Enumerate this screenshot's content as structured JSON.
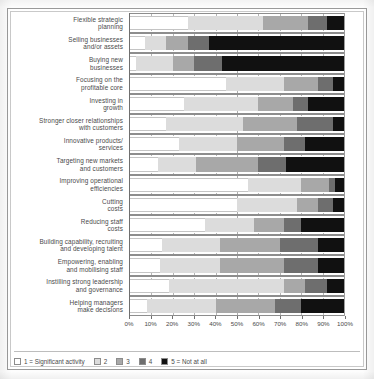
{
  "chart_data": {
    "type": "bar",
    "orientation": "horizontal",
    "stacked": true,
    "stack_mode": "percent",
    "title": "",
    "xlabel": "",
    "ylabel": "",
    "xlim": [
      0,
      100
    ],
    "grid": true,
    "legend_position": "bottom",
    "xticks": [
      "0%",
      "10%",
      "20%",
      "30%",
      "40%",
      "50%",
      "60%",
      "70%",
      "80%",
      "90%",
      "100%"
    ],
    "xtick_values": [
      0,
      10,
      20,
      30,
      40,
      50,
      60,
      70,
      80,
      90,
      100
    ],
    "legend": [
      {
        "key": "1",
        "label": "1 = Significant activity",
        "color": "#ffffff"
      },
      {
        "key": "2",
        "label": "2",
        "color": "#dcdcdc"
      },
      {
        "key": "3",
        "label": "3",
        "color": "#a8a8a8"
      },
      {
        "key": "4",
        "label": "4",
        "color": "#6e6e6e"
      },
      {
        "key": "5",
        "label": "5 = Not at all",
        "color": "#111111"
      }
    ],
    "series": [
      {
        "name": "1 = Significant activity",
        "values": [
          27,
          7,
          3,
          45,
          25,
          17,
          23,
          13,
          55,
          50,
          35,
          15,
          14,
          18,
          8
        ]
      },
      {
        "name": "2",
        "values": [
          35,
          10,
          17,
          27,
          35,
          36,
          27,
          18,
          25,
          28,
          23,
          27,
          28,
          54,
          32
        ]
      },
      {
        "name": "3",
        "values": [
          21,
          10,
          10,
          16,
          16,
          25,
          22,
          29,
          13,
          10,
          14,
          28,
          30,
          10,
          28
        ]
      },
      {
        "name": "4",
        "values": [
          9,
          10,
          13,
          7,
          7,
          17,
          10,
          13,
          3,
          7,
          8,
          18,
          16,
          10,
          12
        ]
      },
      {
        "name": "5 = Not at all",
        "values": [
          8,
          63,
          57,
          5,
          17,
          5,
          18,
          27,
          4,
          5,
          20,
          12,
          12,
          8,
          20
        ]
      }
    ],
    "categories": [
      {
        "lines": [
          "Flexible strategic",
          "planning"
        ]
      },
      {
        "lines": [
          "Selling businesses",
          "and/or assets"
        ]
      },
      {
        "lines": [
          "Buying new",
          "businesses"
        ]
      },
      {
        "lines": [
          "Focusing on the",
          "profitable core"
        ]
      },
      {
        "lines": [
          "Investing in",
          "growth"
        ]
      },
      {
        "lines": [
          "Stronger closer relationships",
          "with customers"
        ]
      },
      {
        "lines": [
          "Innovative products/",
          "services"
        ]
      },
      {
        "lines": [
          "Targeting new markets",
          "and customers"
        ]
      },
      {
        "lines": [
          "Improving operational",
          "efficiencies"
        ]
      },
      {
        "lines": [
          "Cutting",
          "costs"
        ]
      },
      {
        "lines": [
          "Reducing staff",
          "costs"
        ]
      },
      {
        "lines": [
          "Building capability, recruiting",
          "and developing talent"
        ]
      },
      {
        "lines": [
          "Empowering, enabling",
          "and mobilising staff"
        ]
      },
      {
        "lines": [
          "Instilling strong leadership",
          "and governance"
        ]
      },
      {
        "lines": [
          "Helping managers",
          "make decisions"
        ]
      }
    ]
  }
}
